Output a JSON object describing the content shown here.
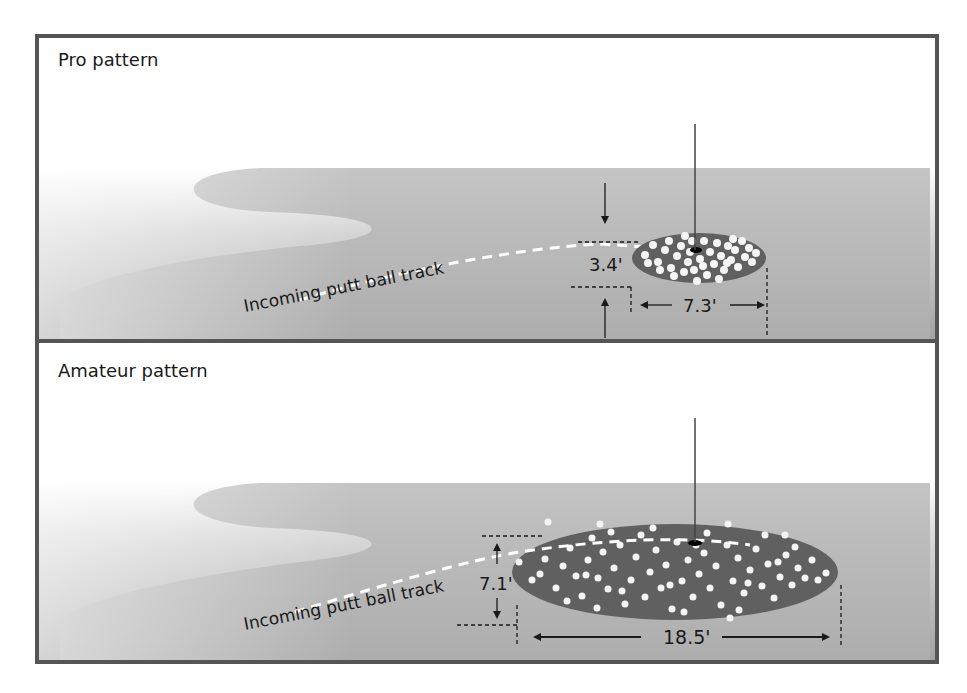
{
  "figure": {
    "panels": [
      {
        "title": "Pro pattern",
        "track_label": "Incoming putt ball track",
        "depth_label": "3.4'",
        "width_label": "7.3'"
      },
      {
        "title": "Amateur pattern",
        "track_label": "Incoming putt ball track",
        "depth_label": "7.1'",
        "width_label": "18.5'"
      }
    ],
    "colors": {
      "frame": "#555555",
      "green_dark": "#9a9a9a",
      "green_light": "#d4d4d4",
      "ellipse": "#606060",
      "ball": "#f4f4f4",
      "text": "#1a1a1a"
    }
  }
}
